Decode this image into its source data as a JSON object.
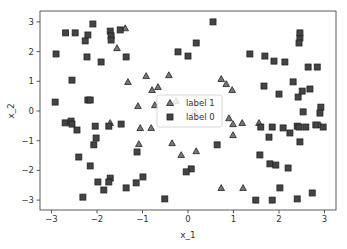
{
  "chart_data": {
    "type": "scatter",
    "title": "",
    "xlabel": "x_1",
    "ylabel": "x_2",
    "xlim": [
      -3.3,
      3.3
    ],
    "ylim": [
      -3.35,
      3.35
    ],
    "xticks": [
      -3,
      -2,
      -1,
      0,
      1,
      2,
      3
    ],
    "yticks": [
      -3,
      -2,
      -1,
      0,
      1,
      2,
      3
    ],
    "xtick_labels": [
      "−3",
      "−2",
      "−1",
      "0",
      "1",
      "2",
      "3"
    ],
    "ytick_labels": [
      "−3",
      "−2",
      "−1",
      "0",
      "1",
      "2",
      "3"
    ],
    "grid": false,
    "legend_position": "center",
    "series": [
      {
        "name": "label 1",
        "marker": "triangle",
        "color": "#555555",
        "edgecolor": "#222222",
        "points": [
          [
            -1.38,
            2.79
          ],
          [
            -1.56,
            2.12
          ],
          [
            -1.32,
            0.98
          ],
          [
            -0.66,
            0.81
          ],
          [
            -0.26,
            0.34
          ],
          [
            -0.92,
            1.18
          ],
          [
            -0.42,
            1.21
          ],
          [
            -0.79,
            0.71
          ],
          [
            -1.1,
            0.17
          ],
          [
            -0.73,
            0.2
          ],
          [
            -1.71,
            -0.4
          ],
          [
            -1.05,
            -0.57
          ],
          [
            -0.81,
            -0.57
          ],
          [
            -1.08,
            -1.11
          ],
          [
            -0.15,
            -1.48
          ],
          [
            -0.35,
            -1.08
          ],
          [
            0.18,
            -1.35
          ],
          [
            0.73,
            -2.59
          ],
          [
            1.21,
            -2.59
          ],
          [
            0.73,
            1.08
          ],
          [
            0.84,
            0.91
          ],
          [
            0.97,
            0.71
          ],
          [
            0.15,
            -0.03
          ],
          [
            0.9,
            -0.24
          ],
          [
            0.99,
            -0.44
          ],
          [
            1.56,
            -0.4
          ],
          [
            1.19,
            -0.4
          ],
          [
            0.99,
            -0.81
          ],
          [
            2.9,
            -0.47
          ]
        ]
      },
      {
        "name": "label 0",
        "marker": "square",
        "color": "#444444",
        "edgecolor": "#222222",
        "points": [
          [
            -2.69,
            2.63
          ],
          [
            -2.48,
            2.63
          ],
          [
            -2.09,
            2.93
          ],
          [
            -1.71,
            2.69
          ],
          [
            -1.69,
            2.53
          ],
          [
            -1.69,
            2.39
          ],
          [
            -2.26,
            2.36
          ],
          [
            -2.2,
            2.56
          ],
          [
            -2.9,
            1.92
          ],
          [
            -2.22,
            1.82
          ],
          [
            -1.91,
            1.65
          ],
          [
            -1.49,
            2.73
          ],
          [
            -1.36,
            1.82
          ],
          [
            -2.55,
            1.04
          ],
          [
            -2.92,
            0.3
          ],
          [
            -2.2,
            0.37
          ],
          [
            -2.15,
            0.37
          ],
          [
            -2.7,
            -0.4
          ],
          [
            -2.57,
            -0.34
          ],
          [
            -2.55,
            -0.44
          ],
          [
            -2.44,
            -0.64
          ],
          [
            -2.04,
            -0.51
          ],
          [
            -2.02,
            -0.91
          ],
          [
            -1.74,
            -0.51
          ],
          [
            -1.47,
            -0.44
          ],
          [
            -2.07,
            -1.14
          ],
          [
            -1.12,
            -1.38
          ],
          [
            -2.4,
            -1.55
          ],
          [
            -2.15,
            -1.85
          ],
          [
            -1.98,
            -2.39
          ],
          [
            -1.71,
            -2.26
          ],
          [
            -1.74,
            -2.39
          ],
          [
            -1.85,
            -2.66
          ],
          [
            -1.14,
            -2.42
          ],
          [
            -1.36,
            -2.59
          ],
          [
            -0.99,
            -2.22
          ],
          [
            -2.31,
            -2.9
          ],
          [
            -0.51,
            -2.96
          ],
          [
            0.55,
            3.0
          ],
          [
            0.18,
            2.29
          ],
          [
            -0.22,
            1.99
          ],
          [
            0.0,
            1.85
          ],
          [
            1.36,
            1.92
          ],
          [
            1.69,
            1.85
          ],
          [
            2.46,
            2.46
          ],
          [
            2.46,
            2.63
          ],
          [
            2.44,
            2.29
          ],
          [
            2.13,
            1.65
          ],
          [
            1.89,
            1.68
          ],
          [
            2.64,
            1.48
          ],
          [
            2.84,
            1.48
          ],
          [
            2.31,
            0.98
          ],
          [
            2.0,
            0.57
          ],
          [
            1.67,
            0.84
          ],
          [
            2.68,
            0.74
          ],
          [
            2.42,
            0.47
          ],
          [
            2.51,
            0.67
          ],
          [
            2.92,
            0.13
          ],
          [
            2.9,
            -0.07
          ],
          [
            2.53,
            -0.03
          ],
          [
            1.6,
            -0.54
          ],
          [
            1.85,
            -0.54
          ],
          [
            2.09,
            -0.57
          ],
          [
            2.59,
            -0.54
          ],
          [
            2.81,
            -0.47
          ],
          [
            2.24,
            -0.74
          ],
          [
            2.4,
            -0.51
          ],
          [
            2.97,
            -0.54
          ],
          [
            1.78,
            -0.88
          ],
          [
            2.46,
            -1.04
          ],
          [
            2.44,
            -0.54
          ],
          [
            1.58,
            -1.48
          ],
          [
            1.8,
            -1.78
          ],
          [
            1.93,
            -1.82
          ],
          [
            2.2,
            -1.92
          ],
          [
            0.64,
            -1.14
          ],
          [
            0.07,
            -1.95
          ],
          [
            -0.04,
            -2.05
          ],
          [
            2.02,
            -2.59
          ],
          [
            2.73,
            -2.76
          ],
          [
            1.49,
            -3.0
          ],
          [
            1.85,
            -3.0
          ],
          [
            2.4,
            -2.96
          ]
        ]
      }
    ]
  },
  "legend": {
    "items": [
      {
        "label": "label 1",
        "marker": "triangle"
      },
      {
        "label": "label 0",
        "marker": "square"
      }
    ]
  },
  "colors": {
    "axes": "#333333",
    "marker_fill": "#444444",
    "triangle_fill": "#777777",
    "marker_edge": "#222222",
    "legend_border": "#cccccc"
  }
}
